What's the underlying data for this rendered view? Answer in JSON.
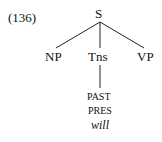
{
  "example_number": "(136)",
  "tree": {
    "root": "S",
    "children": [
      "NP",
      "Tns",
      "VP"
    ],
    "tns_values": [
      "PAST",
      "PRES",
      "will"
    ]
  }
}
